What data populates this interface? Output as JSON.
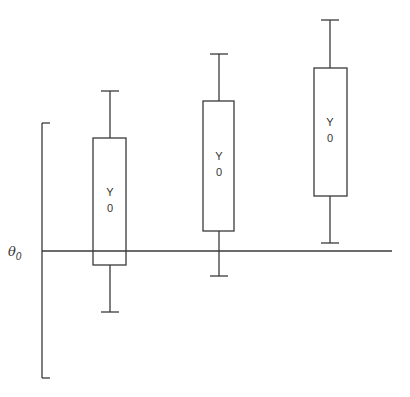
{
  "diagram": {
    "reference_line": {
      "symbol": "θ",
      "subscript": "0",
      "y": 251,
      "x1": 42,
      "x2": 392
    },
    "axis_bracket": {
      "x": 42,
      "y_top": 123,
      "y_bottom": 378,
      "tick_len": 8
    },
    "boxes": [
      {
        "label_top": "Y",
        "label_bottom": "0",
        "cx": 110,
        "left": 93,
        "right": 126,
        "box_top": 138,
        "box_bottom": 265,
        "whisker_top": 91,
        "whisker_bottom": 312,
        "cap_half": 9
      },
      {
        "label_top": "Y",
        "label_bottom": "0",
        "cx": 219,
        "left": 203,
        "right": 234,
        "box_top": 101,
        "box_bottom": 231,
        "whisker_top": 54,
        "whisker_bottom": 276,
        "cap_half": 9
      },
      {
        "label_top": "Y",
        "label_bottom": "0",
        "cx": 330,
        "left": 314,
        "right": 347,
        "box_top": 68,
        "box_bottom": 196,
        "whisker_top": 20,
        "whisker_bottom": 243,
        "cap_half": 9
      }
    ]
  }
}
